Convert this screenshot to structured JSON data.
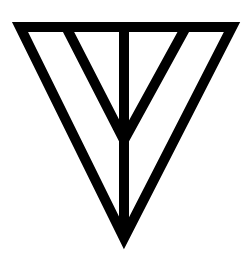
{
  "figure": {
    "description": "Inverted triangle symbol with a central vertical stem and two inner diagonal lines converging on the stem",
    "stroke_color": "#000000",
    "background_color": "#ffffff",
    "stroke_width": 10,
    "outer_triangle": {
      "top_left": [
        20,
        27
      ],
      "top_right": [
        232,
        27
      ],
      "bottom": [
        124,
        238
      ]
    },
    "inner_lines": [
      {
        "from": [
          66,
          27
        ],
        "to": [
          124,
          140
        ]
      },
      {
        "from": [
          186,
          27
        ],
        "to": [
          124,
          140
        ]
      }
    ],
    "stem": {
      "from": [
        124,
        27
      ],
      "to": [
        124,
        238
      ]
    }
  }
}
